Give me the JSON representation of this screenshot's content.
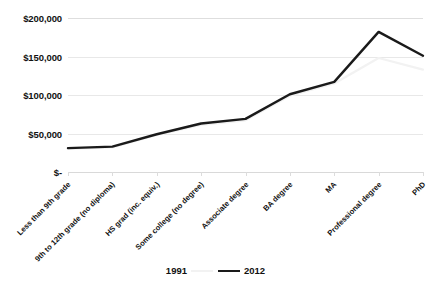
{
  "chart_data": {
    "type": "line",
    "title": "",
    "subtitle": "",
    "xlabel": "",
    "ylabel": "",
    "categories": [
      "Less than 9th grade",
      "9th to 12th grade (no diploma)",
      "HS grad (inc. equiv.)",
      "Some college (no degree)",
      "Associate degree",
      "BA degree",
      "MA",
      "Professional degree",
      "PhD"
    ],
    "series": [
      {
        "name": "1991",
        "color": "#f2f2f2",
        "values": [
          30000,
          32000,
          48000,
          61000,
          67000,
          99000,
          115000,
          148000,
          133000
        ]
      },
      {
        "name": "2012",
        "color": "#1a1a1a",
        "values": [
          31000,
          33000,
          49000,
          63000,
          69000,
          101000,
          117000,
          182000,
          151000
        ]
      }
    ],
    "ylim": [
      0,
      200000
    ],
    "ytick_labels": [
      "$200,000",
      "$150,000",
      "$100,000",
      "$50,000",
      "$-"
    ],
    "ytick_values": [
      200000,
      150000,
      100000,
      50000,
      0
    ],
    "grid": true,
    "legend_position": "bottom"
  },
  "legend": {
    "entries": [
      {
        "label": "1991",
        "color": "#f2f2f2"
      },
      {
        "label": "2012",
        "color": "#1a1a1a"
      }
    ]
  }
}
